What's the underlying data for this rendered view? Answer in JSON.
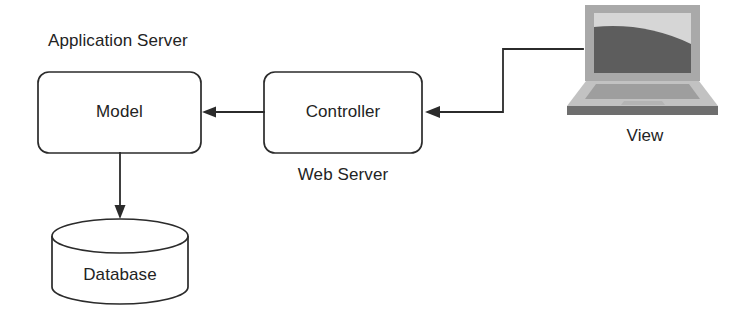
{
  "diagram": {
    "type": "architecture-block-diagram",
    "background_color": "#ffffff",
    "line_color": "#2b2b2b",
    "text_color": "#232323"
  },
  "groups": {
    "application_server": {
      "label": "Application Server",
      "x": 48,
      "y": 46
    },
    "web_server": {
      "label": "Web Server",
      "x": 343,
      "y": 174
    }
  },
  "nodes": {
    "model": {
      "label": "Model",
      "shape": "rounded-rect",
      "x": 38,
      "y": 72,
      "width": 163,
      "height": 81,
      "radius": 11
    },
    "controller": {
      "label": "Controller",
      "shape": "rounded-rect",
      "x": 264,
      "y": 72,
      "width": 158,
      "height": 81,
      "radius": 11
    },
    "database": {
      "label": "Database",
      "shape": "cylinder",
      "x": 52,
      "y": 219,
      "width": 136,
      "height": 85,
      "ellipse_ry": 17
    },
    "view": {
      "label": "View",
      "shape": "laptop-illustration",
      "label_x": 645,
      "label_y": 134,
      "lid": {
        "x": 585,
        "y": 5,
        "width": 115,
        "height": 76
      },
      "screen": {
        "x": 594,
        "y": 13,
        "width": 97,
        "height": 60
      },
      "base": {
        "x": 567,
        "y": 81,
        "width": 151,
        "height": 34
      },
      "colors": {
        "bezel": "#a9a9a9",
        "screen_light": "#d6d6d6",
        "screen_dark": "#5d5d5d",
        "base_top": "#c2c2c2",
        "keyboard": "#9e9e9e",
        "trackpad": "#b4b4b4",
        "front_edge": "#6e6e6e"
      }
    }
  },
  "connectors": [
    {
      "name": "controller-to-model",
      "from": "controller",
      "to": "model",
      "direction": "left",
      "points": "264,112 206,112",
      "arrow_at": "model-right-edge"
    },
    {
      "name": "model-to-database",
      "from": "model",
      "to": "database",
      "direction": "down",
      "points": "120,153 120,214",
      "arrow_at": "database-top"
    },
    {
      "name": "view-to-controller",
      "from": "view",
      "to": "controller",
      "direction": "left",
      "points": "583,49 503,49 503,112 429,112",
      "arrow_at": "controller-right-edge"
    }
  ]
}
